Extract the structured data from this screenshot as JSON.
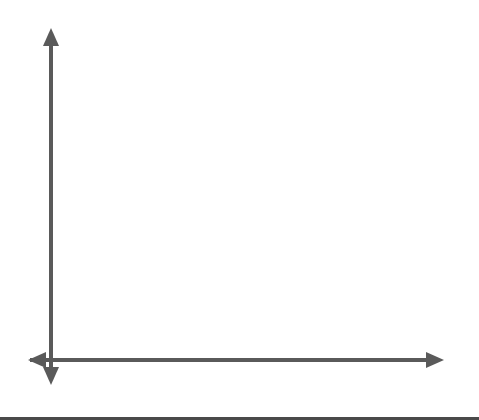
{
  "diagram": {
    "title": "",
    "axes": {
      "x_label": "x",
      "y_label": "y",
      "origin_label": "O"
    },
    "grid": {
      "x_cells": 18,
      "y_cells": 15,
      "style": "dotted"
    },
    "triangles": [
      {
        "name": "original",
        "vertices": [
          {
            "name": "A",
            "prime": false,
            "x": 1,
            "y": 1,
            "label": "A(1, 1)",
            "letter": "A",
            "coords": "(1, 1)"
          },
          {
            "name": "B",
            "prime": false,
            "x": 1,
            "y": 4,
            "label": "B(1, 4)",
            "letter": "B",
            "coords": "(1, 4)"
          },
          {
            "name": "C",
            "prime": false,
            "x": 5,
            "y": 1,
            "label": "C(5, 1)",
            "letter": "C",
            "coords": "(5, 1)"
          }
        ]
      },
      {
        "name": "image",
        "vertices": [
          {
            "name": "A'",
            "prime": true,
            "x": 3,
            "y": 3,
            "label": "A′(3, 3)",
            "letter": "A′",
            "coords": "(3, 3)"
          },
          {
            "name": "B'",
            "prime": true,
            "x": 3,
            "y": 12,
            "label": "B′(3, 12)",
            "letter": "B′",
            "coords": "(3, 12)"
          },
          {
            "name": "C'",
            "prime": true,
            "x": 15,
            "y": 3,
            "label": "C′(15, 3)",
            "letter": "C′",
            "coords": "(15, 3)"
          }
        ]
      }
    ],
    "colors": {
      "grid": "#9a9a9a",
      "axis": "#5a5a5a",
      "triangle_original": "#111111",
      "triangle_image": "#4a4a4a"
    }
  }
}
